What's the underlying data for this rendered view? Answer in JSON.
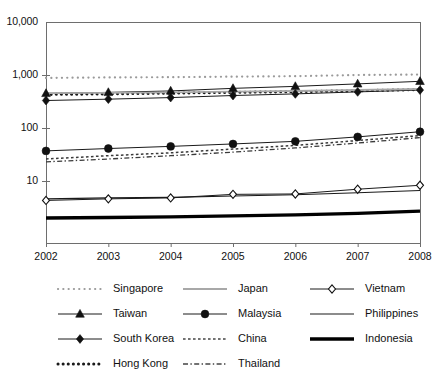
{
  "chart_data": {
    "type": "line",
    "title": "",
    "subtitle": "",
    "xlabel": "",
    "ylabel": "",
    "x": [
      2002,
      2003,
      2004,
      2005,
      2006,
      2007,
      2008
    ],
    "categories": [
      "2002",
      "2003",
      "2004",
      "2005",
      "2006",
      "2007",
      "2008"
    ],
    "yscale": "log",
    "ylim": [
      2.0,
      10000
    ],
    "ytick_labels": [
      "10,000",
      "1,000",
      "100",
      "10"
    ],
    "ytick_values": [
      10000,
      1000,
      100,
      10
    ],
    "grid": false,
    "legend_position": "bottom",
    "legend_columns": 3,
    "series": [
      {
        "name": "Singapore",
        "style": "dotted-light",
        "marker": "none",
        "color": "#9a9a9a",
        "values": [
          880,
          900,
          910,
          930,
          950,
          1000,
          1020
        ]
      },
      {
        "name": "Taiwan",
        "style": "solid-thin",
        "marker": "triangle",
        "color": "#1a1a1a",
        "values": [
          450,
          470,
          500,
          560,
          610,
          680,
          760
        ]
      },
      {
        "name": "South Korea",
        "style": "solid-thin",
        "marker": "diamond",
        "color": "#1a1a1a",
        "values": [
          330,
          350,
          375,
          410,
          440,
          480,
          520
        ]
      },
      {
        "name": "Hong Kong",
        "style": "dotted-bold",
        "marker": "none",
        "color": "#1a1a1a",
        "values": [
          430,
          440,
          455,
          470,
          485,
          505,
          530
        ]
      },
      {
        "name": "Japan",
        "style": "solid-gray",
        "marker": "none",
        "color": "#a8a8a8",
        "values": [
          455,
          460,
          470,
          485,
          500,
          520,
          545
        ]
      },
      {
        "name": "Malaysia",
        "style": "solid-thin",
        "marker": "circle",
        "color": "#1a1a1a",
        "values": [
          37,
          41,
          45,
          50,
          56,
          68,
          85
        ]
      },
      {
        "name": "China",
        "style": "dotted-fine",
        "marker": "none",
        "color": "#3a3a3a",
        "values": [
          26,
          30,
          34,
          40,
          47,
          58,
          72
        ]
      },
      {
        "name": "Thailand",
        "style": "dash-dot",
        "marker": "none",
        "color": "#3a3a3a",
        "values": [
          23,
          26,
          30,
          35,
          42,
          52,
          66
        ]
      },
      {
        "name": "Vietnam",
        "style": "solid-thin",
        "marker": "open-diamond",
        "color": "#1a1a1a",
        "values": [
          4.3,
          4.6,
          4.8,
          5.6,
          5.7,
          7.0,
          8.3
        ]
      },
      {
        "name": "Philippines",
        "style": "solid-thin-plain",
        "marker": "none",
        "color": "#1a1a1a",
        "values": [
          4.6,
          4.8,
          4.9,
          5.2,
          5.5,
          6.0,
          6.6
        ]
      },
      {
        "name": "Indonesia",
        "style": "solid-thick",
        "marker": "none",
        "color": "#000000",
        "values": [
          2.0,
          2.05,
          2.1,
          2.2,
          2.3,
          2.45,
          2.7
        ]
      }
    ]
  },
  "yaxis": {
    "ticks": [
      {
        "label": "10,000",
        "value": 10000
      },
      {
        "label": "1,000",
        "value": 1000
      },
      {
        "label": "100",
        "value": 100
      },
      {
        "label": "10",
        "value": 10
      }
    ]
  },
  "xaxis": {
    "ticks": [
      {
        "label": "2002",
        "value": 2002
      },
      {
        "label": "2003",
        "value": 2003
      },
      {
        "label": "2004",
        "value": 2004
      },
      {
        "label": "2005",
        "value": 2005
      },
      {
        "label": "2006",
        "value": 2006
      },
      {
        "label": "2007",
        "value": 2007
      },
      {
        "label": "2008",
        "value": 2008
      }
    ]
  },
  "legend": {
    "columns": [
      {
        "items": [
          {
            "label": "Singapore",
            "key": "dotted-light-key"
          },
          {
            "label": "Taiwan",
            "key": "triangle-marker-key"
          },
          {
            "label": "South Korea",
            "key": "diamond-marker-key"
          },
          {
            "label": "Hong Kong",
            "key": "dotted-bold-key"
          }
        ]
      },
      {
        "items": [
          {
            "label": "Japan",
            "key": "solid-gray-key"
          },
          {
            "label": "Malaysia",
            "key": "circle-marker-key"
          },
          {
            "label": "China",
            "key": "dotted-fine-key"
          },
          {
            "label": "Thailand",
            "key": "dash-dot-key"
          }
        ]
      },
      {
        "items": [
          {
            "label": "Vietnam",
            "key": "open-diamond-marker-key"
          },
          {
            "label": "Philippines",
            "key": "solid-thin-key"
          },
          {
            "label": "Indonesia",
            "key": "solid-thick-key"
          }
        ]
      }
    ]
  },
  "colors": {
    "ink": "#1a1a1a",
    "frame": "#6e6e6e",
    "gray_series": "#a8a8a8",
    "light_dot": "#9a9a9a",
    "background": "#ffffff"
  }
}
